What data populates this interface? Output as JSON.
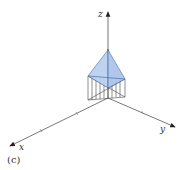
{
  "figure": {
    "caption": "(c)",
    "axes": {
      "x_label": "x",
      "y_label": "y",
      "z_label": "z"
    },
    "colors": {
      "axis": "#555555",
      "fill": "#b8cfee",
      "edge": "#4a6fa8",
      "hatch": "#444444"
    }
  }
}
